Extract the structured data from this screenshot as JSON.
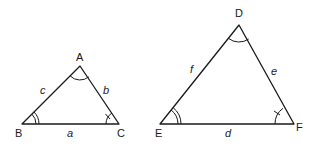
{
  "diagram": {
    "triangles": [
      {
        "name": "ABC",
        "vertices": {
          "A": {
            "label": "A",
            "marker": "single-arc"
          },
          "B": {
            "label": "B",
            "marker": "double-arc"
          },
          "C": {
            "label": "C",
            "marker": "arc-with-tick"
          }
        },
        "sides": {
          "a": {
            "label": "a",
            "between": "B-C"
          },
          "b": {
            "label": "b",
            "between": "A-C"
          },
          "c": {
            "label": "c",
            "between": "A-B"
          }
        }
      },
      {
        "name": "DEF",
        "vertices": {
          "D": {
            "label": "D",
            "marker": "single-arc"
          },
          "E": {
            "label": "E",
            "marker": "double-arc"
          },
          "F": {
            "label": "F",
            "marker": "arc-with-tick"
          }
        },
        "sides": {
          "d": {
            "label": "d",
            "between": "E-F"
          },
          "e": {
            "label": "e",
            "between": "D-F"
          },
          "f": {
            "label": "f",
            "between": "D-E"
          }
        }
      }
    ],
    "colors": {
      "stroke": "#1a1a1a",
      "background": "#ffffff"
    }
  }
}
